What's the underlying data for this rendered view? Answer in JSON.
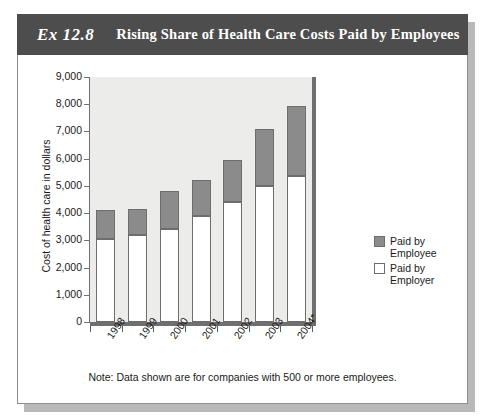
{
  "exhibit": {
    "number": "Ex 12.8",
    "title": "Rising Share of Health Care Costs Paid by Employees",
    "footnote": "Note: Data shown are for companies with 500 or more employees.",
    "header_color": "#4d4d4d",
    "plot_background": "#ececeb"
  },
  "chart_data": {
    "type": "bar",
    "stacked": true,
    "title": "Rising Share of Health Care Costs Paid by Employees",
    "xlabel": "",
    "ylabel": "Cost of health care in dollars",
    "categories": [
      "1998",
      "1999",
      "2000",
      "2001",
      "2002",
      "2003",
      "2004*"
    ],
    "ylim": [
      0,
      9000
    ],
    "ytick_labels": [
      "0",
      "1,000",
      "2,000",
      "3,000",
      "4,000",
      "5,000",
      "6,000",
      "7,000",
      "8,000",
      "9,000"
    ],
    "ytick_values": [
      0,
      1000,
      2000,
      3000,
      4000,
      5000,
      6000,
      7000,
      8000,
      9000
    ],
    "grid": false,
    "legend_position": "right",
    "series": [
      {
        "name": "Paid by Employer",
        "color": "#ffffff",
        "values": [
          3050,
          3200,
          3400,
          3900,
          4400,
          5000,
          5350
        ]
      },
      {
        "name": "Paid by Employee",
        "color": "#8b8b8b",
        "values": [
          1050,
          950,
          1400,
          1300,
          1550,
          2100,
          2600
        ]
      }
    ],
    "totals": [
      4100,
      4150,
      4800,
      5200,
      5950,
      7100,
      7950
    ],
    "annotations": [
      "Note: Data shown are for companies with 500 or more employees."
    ]
  },
  "legend": {
    "items": [
      {
        "label_line1": "Paid by",
        "label_line2": "Employee",
        "swatch": "gray-swatch"
      },
      {
        "label_line1": "Paid by Employer",
        "label_line2": "",
        "swatch": "white-swatch"
      }
    ]
  }
}
